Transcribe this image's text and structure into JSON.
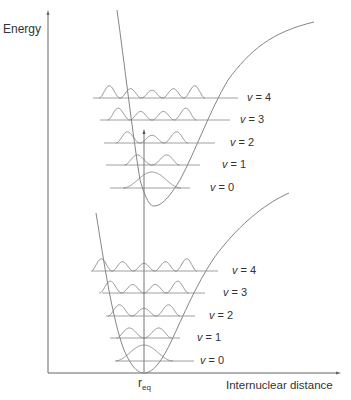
{
  "diagram": {
    "type": "morse-potential-vibrational-levels",
    "y_axis_label": "Energy",
    "x_axis_label": "Internuclear distance",
    "equilibrium_label": "r",
    "equilibrium_subscript": "eq",
    "colors": {
      "line": "#555555",
      "grid": "#888888",
      "text": "#333333"
    },
    "upper_state": {
      "levels": [
        {
          "v": "v",
          "eq": "= 0",
          "y": 188,
          "x1": 110,
          "x2": 190,
          "lx": 210
        },
        {
          "v": "v",
          "eq": "= 1",
          "y": 165,
          "x1": 106,
          "x2": 200,
          "lx": 222
        },
        {
          "v": "v",
          "eq": "= 2",
          "y": 143,
          "x1": 104,
          "x2": 215,
          "lx": 230
        },
        {
          "v": "v",
          "eq": "= 3",
          "y": 120,
          "x1": 100,
          "x2": 230,
          "lx": 240
        },
        {
          "v": "v",
          "eq": "= 4",
          "y": 98,
          "x1": 93,
          "x2": 238,
          "lx": 247
        }
      ]
    },
    "lower_state": {
      "levels": [
        {
          "v": "v",
          "eq": "= 0",
          "y": 361,
          "x1": 116,
          "x2": 194,
          "lx": 200
        },
        {
          "v": "v",
          "eq": "= 1",
          "y": 338,
          "x1": 110,
          "x2": 180,
          "lx": 197
        },
        {
          "v": "v",
          "eq": "= 2",
          "y": 316,
          "x1": 106,
          "x2": 195,
          "lx": 209
        },
        {
          "v": "v",
          "eq": "= 3",
          "y": 293,
          "x1": 102,
          "x2": 205,
          "lx": 223
        },
        {
          "v": "v",
          "eq": "= 4",
          "y": 271,
          "x1": 92,
          "x2": 218,
          "lx": 232
        }
      ]
    },
    "transition": {
      "label": "vertical-excitation-arrow",
      "x": 144,
      "y_from": 372,
      "y_to": 130
    }
  }
}
